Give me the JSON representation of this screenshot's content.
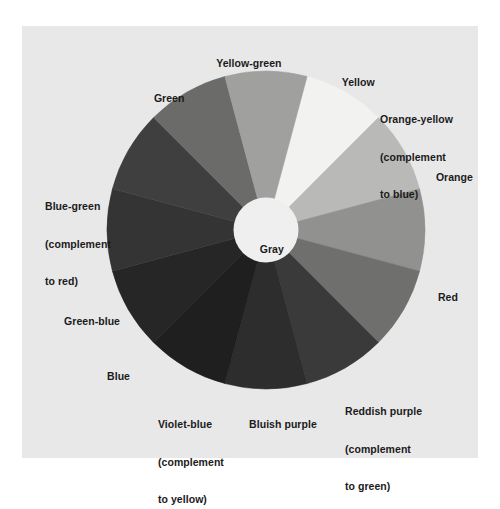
{
  "figure": {
    "type": "color-wheel-diagram",
    "background_color": "#ffffff",
    "panel_color": "#e8e8e8",
    "hub_label": "Gray",
    "hub_color": "#efefef",
    "text_color": "#1b1b1b"
  },
  "chart_data": {
    "type": "pie",
    "title": "",
    "subtitle": "",
    "xlabel": "",
    "ylabel": "",
    "legend_position": "around-wheel",
    "grid": false,
    "center_label": "Gray",
    "slice_count": 12,
    "equal_slices": true,
    "slice_angle_degrees": 30,
    "start_angle_degrees": -75,
    "categories": [
      "Yellow",
      "Orange-yellow",
      "Orange",
      "Red",
      "Reddish purple",
      "Bluish purple",
      "Violet-blue",
      "Blue",
      "Green-blue",
      "Blue-green",
      "Green",
      "Yellow-green"
    ],
    "values": [
      1,
      1,
      1,
      1,
      1,
      1,
      1,
      1,
      1,
      1,
      1,
      1
    ],
    "colors": [
      "#f2f2f0",
      "#b9b9b7",
      "#919190",
      "#6f6f6e",
      "#ララ",
      "#2d2d2d",
      "#1f1f1f",
      "#262626",
      "#343434",
      "#3f3f3f",
      "#6b6b6a",
      "#a0a09e"
    ],
    "slices": [
      {
        "name": "Yellow",
        "label": "Yellow",
        "label_lines": [
          "Yellow"
        ],
        "color": "#f2f2f0",
        "start_angle": -75,
        "end_angle": -45,
        "note": ""
      },
      {
        "name": "Orange-yellow",
        "label": "Orange-yellow (complement to blue)",
        "label_lines": [
          "Orange-yellow",
          "(complement",
          "to blue)"
        ],
        "color": "#b9b9b7",
        "start_angle": -45,
        "end_angle": -15,
        "note": "complement to blue"
      },
      {
        "name": "Orange",
        "label": "Orange",
        "label_lines": [
          "Orange"
        ],
        "color": "#919190",
        "start_angle": -15,
        "end_angle": 15,
        "note": ""
      },
      {
        "name": "Red",
        "label": "Red",
        "label_lines": [
          "Red"
        ],
        "color": "#6f6f6e",
        "start_angle": 15,
        "end_angle": 45,
        "note": ""
      },
      {
        "name": "Reddish purple",
        "label": "Reddish purple (complement to green)",
        "label_lines": [
          "Reddish purple",
          "(complement",
          "to green)"
        ],
        "color": "#3a3a3a",
        "start_angle": 45,
        "end_angle": 75,
        "note": "complement to green"
      },
      {
        "name": "Bluish purple",
        "label": "Bluish purple",
        "label_lines": [
          "Bluish purple"
        ],
        "color": "#2d2d2d",
        "start_angle": 75,
        "end_angle": 105,
        "note": ""
      },
      {
        "name": "Violet-blue",
        "label": "Violet-blue (complement to yellow)",
        "label_lines": [
          "Violet-blue",
          "(complement",
          "to yellow)"
        ],
        "color": "#1f1f1f",
        "start_angle": 105,
        "end_angle": 135,
        "note": "complement to yellow"
      },
      {
        "name": "Blue",
        "label": "Blue",
        "label_lines": [
          "Blue"
        ],
        "color": "#262626",
        "start_angle": 135,
        "end_angle": 165,
        "note": ""
      },
      {
        "name": "Green-blue",
        "label": "Green-blue",
        "label_lines": [
          "Green-blue"
        ],
        "color": "#343434",
        "start_angle": 165,
        "end_angle": 195,
        "note": ""
      },
      {
        "name": "Blue-green",
        "label": "Blue-green (complement to red)",
        "label_lines": [
          "Blue-green",
          "(complement",
          "to red)"
        ],
        "color": "#3f3f3f",
        "start_angle": 195,
        "end_angle": 225,
        "note": "complement to red"
      },
      {
        "name": "Green",
        "label": "Green",
        "label_lines": [
          "Green"
        ],
        "color": "#6b6b6a",
        "start_angle": 225,
        "end_angle": 255,
        "note": ""
      },
      {
        "name": "Yellow-green",
        "label": "Yellow-green",
        "label_lines": [
          "Yellow-green"
        ],
        "color": "#a0a09e",
        "start_angle": 255,
        "end_angle": 285,
        "note": ""
      }
    ]
  },
  "labels": {
    "yellow_green": "Yellow-green",
    "yellow": "Yellow",
    "orange_yellow_l1": "Orange-yellow",
    "orange_yellow_l2": "(complement",
    "orange_yellow_l3": "to blue)",
    "orange": "Orange",
    "red": "Red",
    "reddish_purple_l1": "Reddish purple",
    "reddish_purple_l2": "(complement",
    "reddish_purple_l3": "to green)",
    "bluish_purple": "Bluish purple",
    "violet_blue_l1": "Violet-blue",
    "violet_blue_l2": "(complement",
    "violet_blue_l3": "to yellow)",
    "blue": "Blue",
    "green_blue": "Green-blue",
    "blue_green_l1": "Blue-green",
    "blue_green_l2": "(complement",
    "blue_green_l3": "to red)",
    "green": "Green",
    "gray": "Gray"
  }
}
